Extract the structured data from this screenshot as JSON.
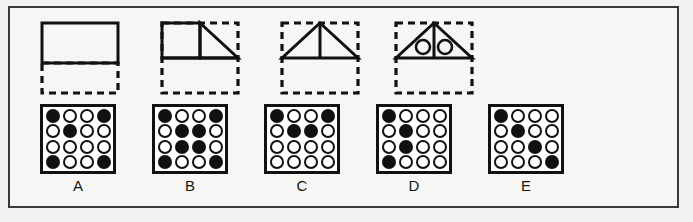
{
  "puzzle": {
    "type": "visual-analogy-matrix",
    "colors": {
      "ink": "#111111",
      "frame": "#3a3a3a",
      "background": "#f6f6f4",
      "tile_background": "#ffffff"
    },
    "sequence": [
      {
        "id": "panel-1",
        "name": "rectangle-over-dashed-box",
        "solid_shapes": [
          "rectangle"
        ],
        "dashed_box": true,
        "circles": 0
      },
      {
        "id": "panel-2",
        "name": "square-and-triangle-in-dashed-box",
        "solid_shapes": [
          "square",
          "right-triangle"
        ],
        "dashed_box": true,
        "circles": 0
      },
      {
        "id": "panel-3",
        "name": "triangle-with-median-in-dashed-box",
        "solid_shapes": [
          "triangle",
          "vertical-median"
        ],
        "dashed_box": true,
        "circles": 0
      },
      {
        "id": "panel-4",
        "name": "triangle-with-two-circles-in-dashed-box",
        "solid_shapes": [
          "triangle",
          "vertical-median"
        ],
        "dashed_box": true,
        "circles": 2
      }
    ],
    "options": [
      {
        "label": "A",
        "rows": 4,
        "cols": 4,
        "filled": [
          [
            1,
            0,
            0,
            1
          ],
          [
            0,
            1,
            0,
            0
          ],
          [
            0,
            0,
            0,
            0
          ],
          [
            1,
            0,
            0,
            1
          ]
        ]
      },
      {
        "label": "B",
        "rows": 4,
        "cols": 4,
        "filled": [
          [
            1,
            0,
            0,
            1
          ],
          [
            0,
            1,
            1,
            0
          ],
          [
            0,
            1,
            1,
            0
          ],
          [
            1,
            0,
            0,
            1
          ]
        ]
      },
      {
        "label": "C",
        "rows": 4,
        "cols": 4,
        "filled": [
          [
            1,
            0,
            0,
            1
          ],
          [
            0,
            1,
            1,
            0
          ],
          [
            0,
            0,
            0,
            0
          ],
          [
            0,
            0,
            0,
            0
          ]
        ]
      },
      {
        "label": "D",
        "rows": 4,
        "cols": 4,
        "filled": [
          [
            1,
            0,
            0,
            0
          ],
          [
            0,
            1,
            0,
            0
          ],
          [
            0,
            1,
            0,
            0
          ],
          [
            1,
            0,
            0,
            0
          ]
        ]
      },
      {
        "label": "E",
        "rows": 4,
        "cols": 4,
        "filled": [
          [
            1,
            0,
            0,
            0
          ],
          [
            0,
            1,
            0,
            0
          ],
          [
            0,
            0,
            1,
            0
          ],
          [
            0,
            0,
            0,
            1
          ]
        ]
      }
    ]
  }
}
